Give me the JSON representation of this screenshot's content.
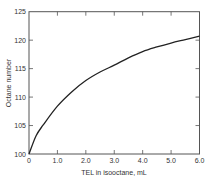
{
  "chart_data": {
    "type": "line",
    "title": "",
    "xlabel": "TEL in isooctane, mL",
    "ylabel": "Octane number",
    "xlim": [
      0,
      6.0
    ],
    "ylim": [
      100,
      125
    ],
    "x_ticks": [
      "0",
      "1.0",
      "2.0",
      "3.0",
      "4.0",
      "5.0",
      "6.0"
    ],
    "y_ticks": [
      "100",
      "105",
      "110",
      "115",
      "120",
      "125"
    ],
    "grid": false,
    "legend": null,
    "series": [
      {
        "name": "Octane number vs TEL",
        "x": [
          0,
          0.25,
          0.5,
          1.0,
          1.5,
          2.0,
          2.5,
          3.0,
          3.5,
          4.0,
          4.5,
          5.0,
          5.5,
          6.0
        ],
        "y": [
          100,
          103.2,
          105.1,
          108.4,
          110.9,
          112.9,
          114.4,
          115.6,
          116.9,
          118.0,
          118.8,
          119.5,
          120.1,
          120.7
        ]
      }
    ],
    "color": "#222222"
  }
}
